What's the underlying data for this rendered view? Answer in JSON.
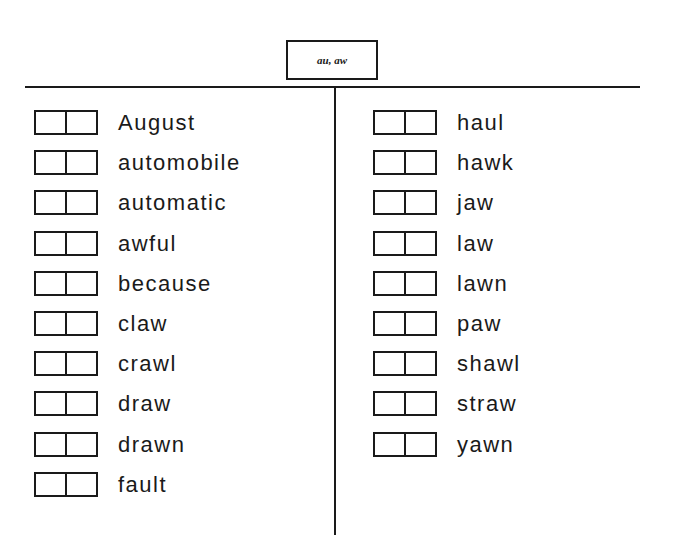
{
  "title": "au, aw",
  "columns": {
    "left": [
      {
        "word": "August"
      },
      {
        "word": "automobile"
      },
      {
        "word": "automatic"
      },
      {
        "word": "awful"
      },
      {
        "word": "because"
      },
      {
        "word": "claw"
      },
      {
        "word": "crawl"
      },
      {
        "word": "draw"
      },
      {
        "word": "drawn"
      },
      {
        "word": "fault"
      }
    ],
    "right": [
      {
        "word": "haul"
      },
      {
        "word": "hawk"
      },
      {
        "word": "jaw"
      },
      {
        "word": "law"
      },
      {
        "word": "lawn"
      },
      {
        "word": "paw"
      },
      {
        "word": "shawl"
      },
      {
        "word": "straw"
      },
      {
        "word": "yawn"
      }
    ]
  }
}
